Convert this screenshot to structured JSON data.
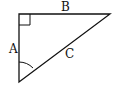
{
  "diagram": {
    "type": "right-triangle",
    "labels": {
      "side_a": "A",
      "side_b": "B",
      "side_c": "C"
    },
    "markers": {
      "right_angle": "top-left vertex",
      "angle_arc": "bottom-left vertex"
    },
    "colors": {
      "stroke": "#111111",
      "background": "#ffffff"
    }
  }
}
